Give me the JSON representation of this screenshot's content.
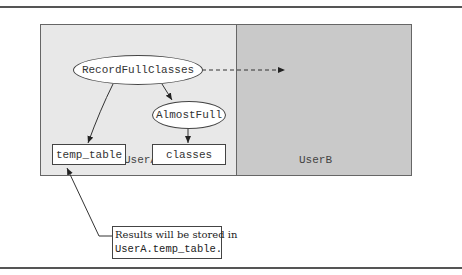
{
  "diagram": {
    "panels": [
      {
        "id": "userA",
        "label": "UserA",
        "color": "#e8e8e8"
      },
      {
        "id": "userB",
        "label": "UserB",
        "color": "#c9c9c9"
      }
    ],
    "nodes": {
      "record_full_classes": "RecordFullClasses",
      "almost_full": "AlmostFull",
      "temp_table": "temp_table",
      "classes": "classes"
    },
    "edges": [
      {
        "from": "RecordFullClasses",
        "to": "temp_table",
        "style": "solid"
      },
      {
        "from": "RecordFullClasses",
        "to": "AlmostFull",
        "style": "solid"
      },
      {
        "from": "AlmostFull",
        "to": "classes",
        "style": "solid"
      },
      {
        "from": "RecordFullClasses",
        "to": "UserB",
        "style": "dashed"
      },
      {
        "from": "callout",
        "to": "temp_table",
        "style": "solid"
      }
    ],
    "callout": {
      "line1": "Results will be stored in",
      "line2": "UserA.temp_table."
    }
  }
}
